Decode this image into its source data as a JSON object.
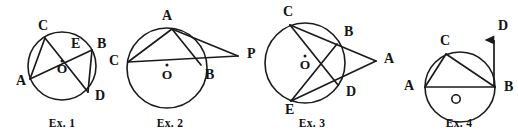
{
  "page": {
    "background_color": "#ffffff",
    "ink_color": "#1b1b1b",
    "width": 518,
    "height": 136
  },
  "figures": [
    {
      "id": "ex1",
      "caption": "Ex. 1",
      "caption_pos": [
        62,
        124
      ],
      "description": "Circle with two intersecting chords AB and CD meeting at interior point E",
      "circle": {
        "cx": 62,
        "cy": 66,
        "r": 34
      },
      "center": {
        "label": "O",
        "x": 62,
        "y": 70,
        "dot_x": 62,
        "dot_y": 61
      },
      "points": [
        {
          "label": "A",
          "x": 30,
          "y": 79,
          "lx": 16,
          "ly": 82
        },
        {
          "label": "B",
          "x": 92,
          "y": 50,
          "lx": 97,
          "ly": 45
        },
        {
          "label": "C",
          "x": 45,
          "y": 38,
          "lx": 38,
          "ly": 27
        },
        {
          "label": "D",
          "x": 88,
          "y": 92,
          "lx": 95,
          "ly": 97
        },
        {
          "label": "E",
          "x": 70,
          "y": 52,
          "lx": 71,
          "ly": 45
        }
      ],
      "segments": [
        {
          "name": "chord-AB",
          "from": "A",
          "to": "B"
        },
        {
          "name": "chord-CD",
          "from": "C",
          "to": "D"
        },
        {
          "name": "chord-AC",
          "from": "A",
          "to": "C"
        },
        {
          "name": "chord-BD",
          "from": "B",
          "to": "D"
        }
      ]
    },
    {
      "id": "ex2",
      "caption": "Ex. 2",
      "caption_pos": [
        170,
        124
      ],
      "description": "Circle with secant CB extended to external point P and chord CA, AB, with AP tangent-like segment",
      "circle": {
        "cx": 167,
        "cy": 68,
        "r": 40
      },
      "center": {
        "label": "O",
        "x": 167,
        "y": 76,
        "dot_x": 167,
        "dot_y": 65
      },
      "points": [
        {
          "label": "A",
          "x": 172,
          "y": 29,
          "lx": 167,
          "ly": 17
        },
        {
          "label": "B",
          "x": 201,
          "y": 65,
          "lx": 205,
          "ly": 76
        },
        {
          "label": "C",
          "x": 128,
          "y": 62,
          "lx": 119,
          "ly": 62
        },
        {
          "label": "P",
          "x": 238,
          "y": 56,
          "lx": 247,
          "ly": 55
        }
      ],
      "segments": [
        {
          "name": "chord-CA",
          "from": "C",
          "to": "A"
        },
        {
          "name": "chord-AB",
          "from": "A",
          "to": "B"
        },
        {
          "name": "secant-CP",
          "from": "C",
          "to": "P"
        },
        {
          "name": "segment-AP",
          "from": "A",
          "to": "P"
        }
      ]
    },
    {
      "id": "ex3",
      "caption": "Ex. 3",
      "caption_pos": [
        312,
        124
      ],
      "description": "Circle with two secants from external point A: A through B to C, and A through D to E; chords CD and BE drawn",
      "circle": {
        "cx": 305,
        "cy": 63,
        "r": 40
      },
      "center": {
        "label": "O",
        "x": 305,
        "y": 66,
        "dot_x": 305,
        "dot_y": 56
      },
      "points": [
        {
          "label": "C",
          "x": 290,
          "y": 25,
          "lx": 283,
          "ly": 13
        },
        {
          "label": "B",
          "x": 337,
          "y": 44,
          "lx": 344,
          "ly": 33
        },
        {
          "label": "A",
          "x": 376,
          "y": 61,
          "lx": 384,
          "ly": 60
        },
        {
          "label": "D",
          "x": 338,
          "y": 85,
          "lx": 346,
          "ly": 93
        },
        {
          "label": "E",
          "x": 291,
          "y": 101,
          "lx": 285,
          "ly": 111
        }
      ],
      "segments": [
        {
          "name": "secant-CA-through-B",
          "from": "C",
          "to": "A"
        },
        {
          "name": "secant-EA-through-D",
          "from": "E",
          "to": "A"
        },
        {
          "name": "chord-CD",
          "from": "C",
          "to": "D"
        },
        {
          "name": "chord-BE",
          "from": "B",
          "to": "E"
        }
      ]
    },
    {
      "id": "ex4",
      "caption": "Ex. 4",
      "caption_pos": [
        459,
        124
      ],
      "description": "Circle with diameter AB, chord AC and CB, and tangent ray from B up to D",
      "circle": {
        "cx": 460,
        "cy": 87,
        "r": 35
      },
      "center": {
        "label": "O",
        "x": 456,
        "y": 99,
        "dot_x": null,
        "dot_y": null
      },
      "points": [
        {
          "label": "A",
          "x": 425,
          "y": 87,
          "lx": 414,
          "ly": 87
        },
        {
          "label": "B",
          "x": 495,
          "y": 87,
          "lx": 504,
          "ly": 88
        },
        {
          "label": "C",
          "x": 446,
          "y": 54,
          "lx": 440,
          "ly": 42
        },
        {
          "label": "D",
          "x": 494,
          "y": 36,
          "lx": 498,
          "ly": 27
        }
      ],
      "segments": [
        {
          "name": "diameter-AB",
          "from": "A",
          "to": "B"
        },
        {
          "name": "chord-AC",
          "from": "A",
          "to": "C"
        },
        {
          "name": "chord-CB",
          "from": "C",
          "to": "B"
        }
      ],
      "ray": {
        "name": "tangent-ray-BD",
        "from": "B",
        "to_x": 494,
        "to_y": 38,
        "arrow": true
      }
    }
  ]
}
